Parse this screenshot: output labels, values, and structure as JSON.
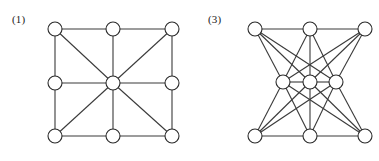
{
  "figure": {
    "background_color": "#ffffff",
    "edge_color": "#3a3a3a",
    "node_fill_color": "#ffffff",
    "node_stroke_color": "#2b2b2b",
    "node_radius": 7,
    "panels": [
      {
        "id": "panel-1",
        "label": "(1)",
        "label_x": 12,
        "label_y": 14,
        "description": "3x3 grid graph with four diagonals joining the corner vertices to the center vertex",
        "nodes": [
          {
            "id": "n1",
            "name": "top-left",
            "x": 55,
            "y": 29
          },
          {
            "id": "n2",
            "name": "top-center",
            "x": 113,
            "y": 29
          },
          {
            "id": "n3",
            "name": "top-right",
            "x": 172,
            "y": 29
          },
          {
            "id": "n4",
            "name": "middle-left",
            "x": 55,
            "y": 83
          },
          {
            "id": "n5",
            "name": "center",
            "x": 113,
            "y": 83
          },
          {
            "id": "n6",
            "name": "middle-right",
            "x": 172,
            "y": 83
          },
          {
            "id": "n7",
            "name": "bottom-left",
            "x": 55,
            "y": 136
          },
          {
            "id": "n8",
            "name": "bottom-center",
            "x": 113,
            "y": 136
          },
          {
            "id": "n9",
            "name": "bottom-right",
            "x": 172,
            "y": 136
          }
        ],
        "edges": [
          [
            "n1",
            "n2"
          ],
          [
            "n2",
            "n3"
          ],
          [
            "n4",
            "n5"
          ],
          [
            "n5",
            "n6"
          ],
          [
            "n7",
            "n8"
          ],
          [
            "n8",
            "n9"
          ],
          [
            "n1",
            "n4"
          ],
          [
            "n4",
            "n7"
          ],
          [
            "n2",
            "n5"
          ],
          [
            "n5",
            "n8"
          ],
          [
            "n3",
            "n6"
          ],
          [
            "n6",
            "n9"
          ],
          [
            "n1",
            "n5"
          ],
          [
            "n3",
            "n5"
          ],
          [
            "n7",
            "n5"
          ],
          [
            "n9",
            "n5"
          ]
        ]
      },
      {
        "id": "panel-3",
        "label": "(3)",
        "label_x": 18,
        "label_y": 14,
        "description": "Three-layer graph: top row of three vertices and bottom row of three vertices, each fully joined to a narrowed middle row of three vertices; rows also linked along their own line",
        "nodes": [
          {
            "id": "m1",
            "name": "top-left",
            "x": 65,
            "y": 29
          },
          {
            "id": "m2",
            "name": "top-center",
            "x": 120,
            "y": 29
          },
          {
            "id": "m3",
            "name": "top-right",
            "x": 175,
            "y": 29
          },
          {
            "id": "m4",
            "name": "middle-left",
            "x": 93,
            "y": 82
          },
          {
            "id": "m5",
            "name": "middle-center",
            "x": 120,
            "y": 82
          },
          {
            "id": "m6",
            "name": "middle-right",
            "x": 146,
            "y": 82
          },
          {
            "id": "m7",
            "name": "bottom-left",
            "x": 65,
            "y": 136
          },
          {
            "id": "m8",
            "name": "bottom-center",
            "x": 120,
            "y": 136
          },
          {
            "id": "m9",
            "name": "bottom-right",
            "x": 175,
            "y": 136
          }
        ],
        "edges": [
          [
            "m1",
            "m2"
          ],
          [
            "m2",
            "m3"
          ],
          [
            "m4",
            "m5"
          ],
          [
            "m5",
            "m6"
          ],
          [
            "m7",
            "m8"
          ],
          [
            "m8",
            "m9"
          ],
          [
            "m1",
            "m4"
          ],
          [
            "m1",
            "m5"
          ],
          [
            "m1",
            "m6"
          ],
          [
            "m2",
            "m4"
          ],
          [
            "m2",
            "m5"
          ],
          [
            "m2",
            "m6"
          ],
          [
            "m3",
            "m4"
          ],
          [
            "m3",
            "m5"
          ],
          [
            "m3",
            "m6"
          ],
          [
            "m7",
            "m4"
          ],
          [
            "m7",
            "m5"
          ],
          [
            "m7",
            "m6"
          ],
          [
            "m8",
            "m4"
          ],
          [
            "m8",
            "m5"
          ],
          [
            "m8",
            "m6"
          ],
          [
            "m9",
            "m4"
          ],
          [
            "m9",
            "m5"
          ],
          [
            "m9",
            "m6"
          ]
        ]
      }
    ]
  }
}
